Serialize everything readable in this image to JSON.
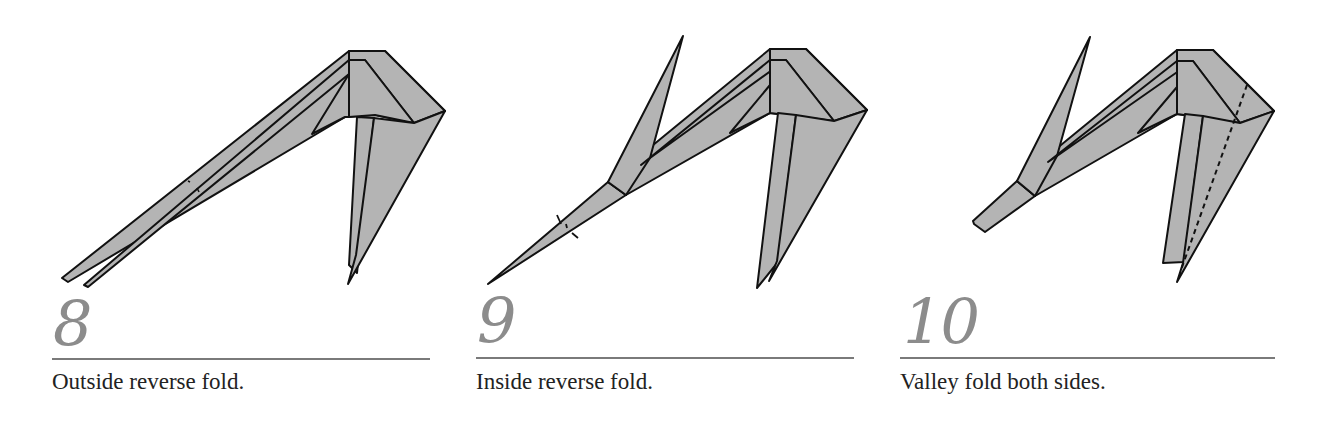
{
  "steps": [
    {
      "number": "8",
      "instruction": "Outside reverse fold."
    },
    {
      "number": "9",
      "instruction": "Inside reverse fold."
    },
    {
      "number": "10",
      "instruction": "Valley fold both sides."
    }
  ],
  "colors": {
    "paper_fill": "#b4b4b4",
    "outline": "#111111",
    "step_number": "#8c8c8c",
    "rule": "#7a7a7a",
    "caption_text": "#222222"
  }
}
